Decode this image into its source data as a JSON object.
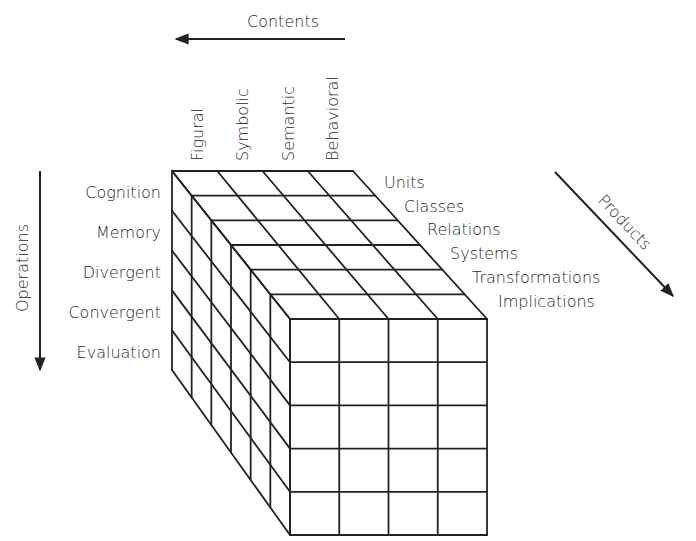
{
  "axes": {
    "contents": {
      "label": "Contents",
      "items": [
        "Figural",
        "Symbolic",
        "Semantic",
        "Behavioral"
      ]
    },
    "operations": {
      "label": "Operations",
      "items": [
        "Cognition",
        "Memory",
        "Divergent",
        "Convergent",
        "Evaluation"
      ]
    },
    "products": {
      "label": "Products",
      "items": [
        "Units",
        "Classes",
        "Relations",
        "Systems",
        "Transformations",
        "Implications"
      ]
    }
  },
  "cube": {
    "columns": 4,
    "rows": 5,
    "layers": 6,
    "line_color": "#222222"
  }
}
